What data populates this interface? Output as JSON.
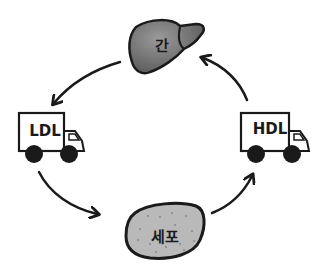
{
  "diagram": {
    "nodes": [
      {
        "id": "liver",
        "label": "간",
        "shape": "liver"
      },
      {
        "id": "ldl",
        "label": "LDL",
        "shape": "truck"
      },
      {
        "id": "cell",
        "label": "세포",
        "shape": "blob"
      },
      {
        "id": "hdl",
        "label": "HDL",
        "shape": "truck"
      }
    ],
    "edges": [
      {
        "from": "liver",
        "to": "ldl"
      },
      {
        "from": "ldl",
        "to": "cell"
      },
      {
        "from": "cell",
        "to": "hdl"
      },
      {
        "from": "hdl",
        "to": "liver"
      }
    ],
    "colors": {
      "liver_fill": "#6e6e6e",
      "cell_fill": "#b9b9b9",
      "stroke": "#1a1a1a",
      "truck_fill": "#ffffff"
    }
  }
}
